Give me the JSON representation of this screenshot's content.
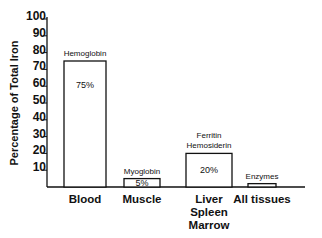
{
  "chart_data": {
    "type": "bar",
    "title": "",
    "xlabel": "",
    "ylabel": "Percentage of Total Iron",
    "ylim": [
      0,
      100
    ],
    "yticks": [
      10,
      20,
      30,
      40,
      50,
      60,
      70,
      80,
      90,
      100
    ],
    "grid": false,
    "categories": [
      [
        "Blood"
      ],
      [
        "Muscle"
      ],
      [
        "Liver",
        "Spleen",
        "Marrow"
      ],
      [
        "All tissues"
      ]
    ],
    "category_labels": [
      "Blood",
      "Muscle",
      "Liver Spleen Marrow",
      "All tissues"
    ],
    "values": [
      75,
      5,
      20,
      2
    ],
    "annotations": [
      [
        "Hemoglobin"
      ],
      [
        "Myoglobin"
      ],
      [
        "Ferritin",
        "Hemosiderin"
      ],
      [
        "Enzymes"
      ]
    ],
    "value_labels": [
      "75%",
      "5%",
      "20%",
      ""
    ]
  },
  "layout": {
    "axis_x": 47,
    "baseline_y": 187,
    "px_per_unit": 1.68,
    "baseline_end_x": 305,
    "bars": [
      {
        "x": 64,
        "w": 42
      },
      {
        "x": 124,
        "w": 36
      },
      {
        "x": 186,
        "w": 46
      },
      {
        "x": 248,
        "w": 28
      }
    ],
    "colors": {
      "ink": "#111111",
      "fill": "#ffffff"
    }
  }
}
